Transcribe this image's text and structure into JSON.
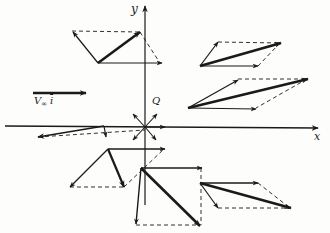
{
  "figure": {
    "type": "vector-superposition-diagram"
  },
  "axes": {
    "x_label": "x",
    "y_label": "y",
    "origin": [
      145,
      127
    ]
  },
  "source": {
    "label": "Q",
    "position": [
      145,
      127
    ]
  },
  "freestream": {
    "label_main": "V",
    "label_sub": "∞",
    "label_unit": "i",
    "arrow": {
      "from": [
        33,
        93
      ],
      "to": [
        85,
        93
      ]
    }
  },
  "colors": {
    "ink": "#1a1a1a",
    "background": "#fdfdfc"
  },
  "parallelograms": [
    {
      "name": "top-left",
      "base": [
        98,
        63
      ],
      "freestream": [
        160,
        63
      ],
      "source": [
        72,
        31
      ],
      "resultant": [
        140,
        32
      ]
    },
    {
      "name": "top-right-upper",
      "base": [
        200,
        66
      ],
      "freestream": [
        258,
        66
      ],
      "source": [
        218,
        42
      ],
      "resultant": [
        280,
        43
      ]
    },
    {
      "name": "top-right-lower",
      "base": [
        188,
        108
      ],
      "freestream": [
        256,
        108
      ],
      "source": [
        238,
        79
      ],
      "resultant": [
        307,
        79
      ]
    },
    {
      "name": "left-axis",
      "base": [
        104,
        126
      ],
      "freestream": [
        145,
        129
      ],
      "source": [
        38,
        137
      ],
      "resultant": [
        106,
        137
      ]
    },
    {
      "name": "bottom-left",
      "base": [
        108,
        149
      ],
      "freestream": [
        164,
        149
      ],
      "source": [
        70,
        187
      ],
      "resultant": [
        124,
        187
      ]
    },
    {
      "name": "bottom-middle",
      "base": [
        141,
        168
      ],
      "freestream": [
        200,
        168
      ],
      "source": [
        136,
        225
      ],
      "resultant": [
        200,
        226
      ]
    },
    {
      "name": "bottom-right",
      "base": [
        200,
        183
      ],
      "freestream": [
        258,
        183
      ],
      "source": [
        218,
        208
      ],
      "resultant": [
        290,
        208
      ]
    }
  ]
}
